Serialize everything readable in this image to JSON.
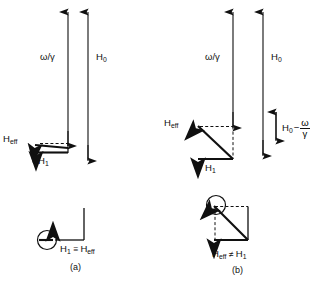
{
  "figure": {
    "background_color": "#ffffff",
    "line_color": "#101010",
    "panels": [
      {
        "tag": "(a)",
        "condition": "on resonance",
        "labels": {
          "omega_over_gamma": "ω/γ",
          "h0": "H",
          "h0_sub": "0",
          "heff": "H",
          "heff_sub": "eff",
          "h1": "H",
          "h1_sub": "1"
        },
        "inset": {
          "relation_left": "H",
          "relation_left_sub": "1",
          "relation_symbol": "≡",
          "relation_right": "H",
          "relation_right_sub": "eff"
        }
      },
      {
        "tag": "(b)",
        "condition": "off resonance",
        "labels": {
          "omega_over_gamma": "ω/γ",
          "h0": "H",
          "h0_sub": "0",
          "heff": "H",
          "heff_sub": "eff",
          "h1": "H",
          "h1_sub": "1",
          "difference_lead": "H",
          "difference_lead_sub": "0",
          "difference_minus": "−",
          "difference_num": "ω",
          "difference_den": "γ"
        },
        "inset": {
          "relation_left": "H",
          "relation_left_sub": "eff",
          "relation_symbol": "≠",
          "relation_right": "H",
          "relation_right_sub": "1"
        }
      }
    ]
  }
}
